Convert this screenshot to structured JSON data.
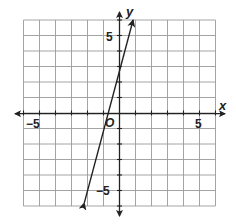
{
  "chart_data": {
    "type": "line",
    "title": "",
    "xlabel": "x",
    "ylabel": "y",
    "origin_label": "O",
    "xlim": [
      -6,
      6
    ],
    "ylim": [
      -6,
      6
    ],
    "grid": true,
    "x_tick_labels": [
      {
        "value": -5,
        "label": "−5"
      },
      {
        "value": 5,
        "label": "5"
      }
    ],
    "y_tick_labels": [
      {
        "value": 5,
        "label": "5"
      },
      {
        "value": -5,
        "label": "−5"
      }
    ],
    "series": [
      {
        "name": "line",
        "equation": "y = 4x + 3",
        "slope": 4,
        "intercept": 3,
        "x": [
          -2.2,
          -0.75,
          0,
          0.85
        ],
        "y": [
          -5.8,
          0,
          3,
          6.4
        ],
        "arrows": "both"
      }
    ],
    "legend": null
  },
  "labels": {
    "x_axis": "x",
    "y_axis": "y",
    "origin": "O",
    "x_neg5": "−5",
    "x_pos5": "5",
    "y_pos5": "5",
    "y_neg5": "−5"
  },
  "colors": {
    "grid": "#9a9a9a",
    "axis": "#222222",
    "line": "#222222"
  }
}
